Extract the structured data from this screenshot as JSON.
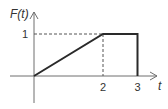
{
  "diagram": {
    "type": "piecewise-function-graph",
    "y_axis_label": "F(t)",
    "x_axis_label": "t",
    "x_ticks": [
      "2",
      "3"
    ],
    "y_ticks": [
      "1"
    ],
    "function_points": [
      [
        0,
        0
      ],
      [
        2,
        1
      ],
      [
        3,
        1
      ],
      [
        3,
        0
      ]
    ],
    "guides": [
      {
        "from": [
          0,
          1
        ],
        "to": [
          2,
          1
        ],
        "style": "dashed"
      },
      {
        "from": [
          2,
          1
        ],
        "to": [
          2,
          0
        ],
        "style": "dashed"
      }
    ],
    "x_range": [
      0,
      3
    ],
    "y_range": [
      0,
      1
    ],
    "colors": {
      "axis": "#6e6e6e",
      "curve": "#2a2a2a",
      "guide": "#555555",
      "text": "#333333"
    }
  }
}
